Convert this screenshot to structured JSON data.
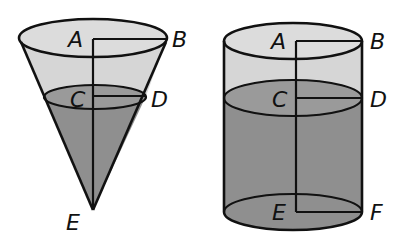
{
  "figure": {
    "colors": {
      "empty_region": "#d6d6d6",
      "filled_region": "#8f8f8f",
      "surface_region": "#9a9a9a",
      "outline": "#111111",
      "background": "#ffffff"
    }
  },
  "cone": {
    "labels": {
      "A": "A",
      "B": "B",
      "C": "C",
      "D": "D",
      "E": "E"
    }
  },
  "cylinder": {
    "labels": {
      "A": "A",
      "B": "B",
      "C": "C",
      "D": "D",
      "E": "E",
      "F": "F"
    }
  }
}
